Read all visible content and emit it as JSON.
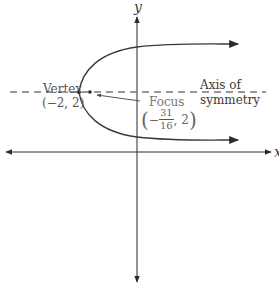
{
  "diagram": {
    "type": "parabola-graph",
    "axes": {
      "x_label": "x",
      "y_label": "y"
    },
    "axis_of_symmetry": {
      "label_line1": "Axis of",
      "label_line2": "symmetry"
    },
    "vertex": {
      "label": "Vertex",
      "coords": "(−2, 2)"
    },
    "focus": {
      "label": "Focus",
      "open_paren": "(",
      "sign": "−",
      "numerator": "31",
      "denominator": "16",
      "rest": ", 2",
      "close_paren": ")"
    },
    "colors": {
      "axis": "#2a2a2a",
      "curve": "#3a3a3a",
      "dash": "#777777",
      "text": "#3a3a3a",
      "focus_text": "#666666"
    }
  }
}
